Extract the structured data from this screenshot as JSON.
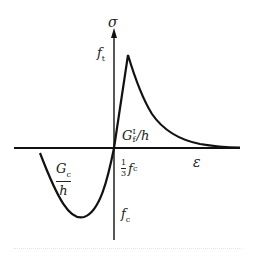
{
  "diagram": {
    "type": "stress-strain constitutive curve",
    "axes": {
      "x_label": "ε",
      "y_label": "σ"
    },
    "labels": {
      "tensile_strength": {
        "base": "f",
        "sub": "t"
      },
      "fracture_energy": {
        "base": "G",
        "sub": "f",
        "sup": "I",
        "tail": "/h"
      },
      "compressive_energy": {
        "numerator_base": "G",
        "numerator_sub": "c",
        "denominator": "h"
      },
      "one_third_fc": {
        "numerator": "1",
        "denominator": "3",
        "base": "f",
        "sub": "c"
      },
      "compressive_strength": {
        "base": "f",
        "sub": "c"
      }
    },
    "curve": {
      "tension_branch": "linear rise to peak f_t then exponential softening",
      "compression_branch": "parabolic to peak f_c then softening"
    },
    "colors": {
      "line": "#111111",
      "background": "#ffffff"
    }
  }
}
